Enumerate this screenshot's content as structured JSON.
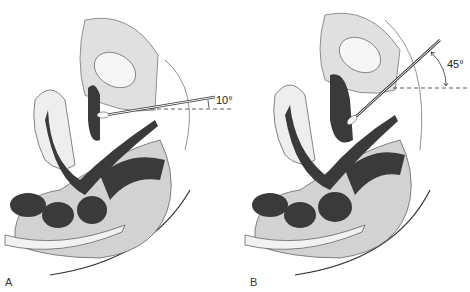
{
  "figure": {
    "panels": [
      {
        "label": "A",
        "angle_label": "10°",
        "angle_deg": 10
      },
      {
        "label": "B",
        "angle_label": "45°",
        "angle_deg": 45
      }
    ]
  },
  "colors": {
    "tissue_light": "#e2e2e2",
    "tissue_mid": "#c8c8c8",
    "tissue_dark": "#3a3a3a",
    "outline": "#555555",
    "background": "#ffffff"
  }
}
